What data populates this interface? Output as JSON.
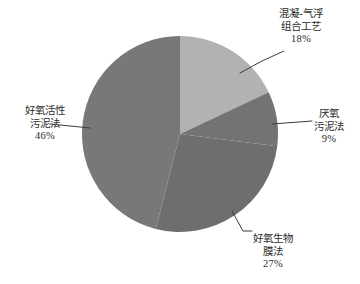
{
  "chart_data": {
    "type": "pie",
    "title": "",
    "subtitle": "",
    "xlabel": "",
    "ylabel": "",
    "legend_position": "none",
    "grid": false,
    "units": "percent",
    "total": 100,
    "start_angle_deg": 0,
    "direction": "clockwise",
    "categories": [
      "混凝-气浮组合工艺",
      "厌氧污泥法",
      "好氧生物膜法",
      "好氧活性污泥法"
    ],
    "values": [
      18,
      9,
      27,
      46
    ],
    "colors": [
      "#b2b2b2",
      "#737373",
      "#6e6e6e",
      "#787878"
    ],
    "slices": [
      {
        "label_lines": [
          "混凝-气浮",
          "组合工艺"
        ],
        "name": "混凝-气浮组合工艺",
        "value": 18,
        "percent_text": "18%",
        "color": "#b2b2b2",
        "start_deg": 0,
        "end_deg": 64.8
      },
      {
        "label_lines": [
          "厌氧",
          "污泥法"
        ],
        "name": "厌氧污泥法",
        "value": 9,
        "percent_text": "9%",
        "color": "#737373",
        "start_deg": 64.8,
        "end_deg": 97.2
      },
      {
        "label_lines": [
          "好氧生物",
          "膜法"
        ],
        "name": "好氧生物膜法",
        "value": 27,
        "percent_text": "27%",
        "color": "#6e6e6e",
        "start_deg": 97.2,
        "end_deg": 194.4
      },
      {
        "label_lines": [
          "好氧活性",
          "污泥法"
        ],
        "name": "好氧活性污泥法",
        "value": 46,
        "percent_text": "46%",
        "color": "#787878",
        "start_deg": 194.4,
        "end_deg": 360
      }
    ]
  },
  "labels": {
    "coagulation": {
      "line1": "混凝-气浮",
      "line2": "组合工艺",
      "percent": "18%"
    },
    "anaerobic": {
      "line1": "厌氧",
      "line2": "污泥法",
      "percent": "9%"
    },
    "biofilm": {
      "line1": "好氧生物",
      "line2": "膜法",
      "percent": "27%"
    },
    "aerobic": {
      "line1": "好氧活性",
      "line2": "污泥法",
      "percent": "46%"
    }
  },
  "style": {
    "background": "#ffffff",
    "leader_line_color": "#3a3a3a",
    "text_color": "#2b2b2b"
  }
}
